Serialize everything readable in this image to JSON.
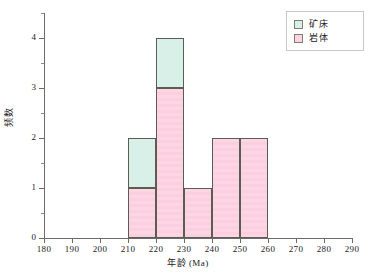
{
  "chart_data": {
    "type": "bar",
    "title": "",
    "xlabel": "年龄 (Ma)",
    "ylabel": "频数",
    "xlim": [
      180,
      290
    ],
    "ylim": [
      0,
      4
    ],
    "xticks": [
      180,
      190,
      200,
      210,
      220,
      230,
      240,
      250,
      260,
      270,
      280,
      290
    ],
    "xtick_labels": [
      "180",
      "190",
      "200",
      "210",
      "220",
      "230",
      "240",
      "250",
      "260",
      "270",
      "280",
      "290"
    ],
    "yticks": [
      0,
      1,
      2,
      3,
      4
    ],
    "ytick_labels": [
      "0",
      "1",
      "2",
      "3",
      "4"
    ],
    "y_minor_ticks": [
      0.5,
      1.5,
      2.5,
      3.5,
      4.5
    ],
    "grid": false,
    "stacked": true,
    "bin_width": 10,
    "bins": [
      {
        "start": 210,
        "end": 220
      },
      {
        "start": 220,
        "end": 230
      },
      {
        "start": 230,
        "end": 240
      },
      {
        "start": 240,
        "end": 250
      },
      {
        "start": 250,
        "end": 260
      }
    ],
    "categories": [
      "210-220",
      "220-230",
      "230-240",
      "240-250",
      "250-260"
    ],
    "series": [
      {
        "name": "岩体",
        "color": "#fbd4e2",
        "values": [
          1,
          3,
          1,
          2,
          2
        ]
      },
      {
        "name": "矿床",
        "color": "#d9f0e8",
        "values": [
          1,
          1,
          0,
          0,
          0
        ]
      }
    ],
    "totals": [
      2,
      4,
      1,
      2,
      2
    ],
    "legend_position": "top-right",
    "legend_entries": [
      {
        "label": "矿床",
        "color": "#d9f0e8"
      },
      {
        "label": "岩体",
        "color": "#fbd4e2"
      }
    ]
  },
  "colors": {
    "kuangchuang": "#d9f0e8",
    "yanti": "#fbd4e2",
    "bar_edge": "#5c5c52",
    "axis": "#6b6b6b",
    "background": "#ffffff",
    "text": "#1a1a1a"
  }
}
